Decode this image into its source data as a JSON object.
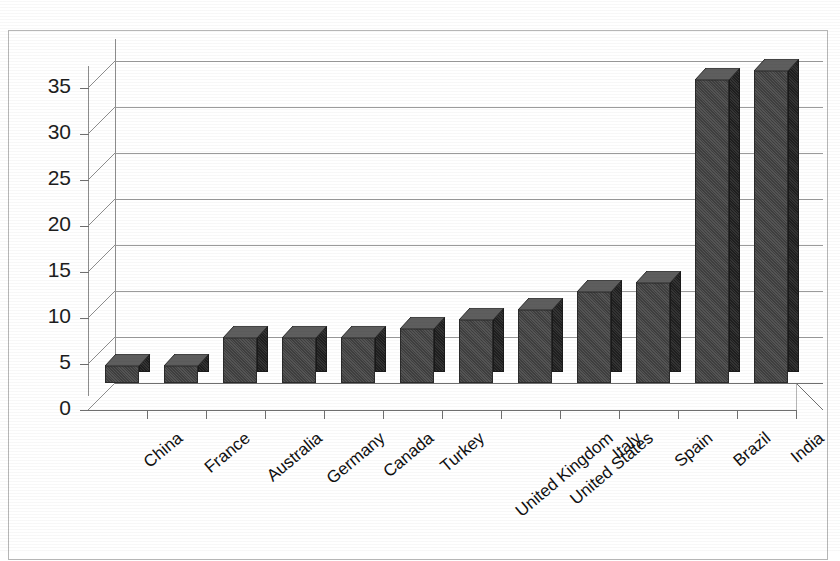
{
  "chart_title": "",
  "chart_data": {
    "type": "bar",
    "title": "",
    "subtitle": "",
    "xlabel": "",
    "ylabel": "",
    "categories": [
      "China",
      "France",
      "Australia",
      "Germany",
      "Canada",
      "Turkey",
      "United Kingdom",
      "United States",
      "Italy",
      "Spain",
      "Brazil",
      "India"
    ],
    "values": [
      2,
      2,
      5,
      5,
      5,
      6,
      7,
      8,
      10,
      11,
      33,
      34
    ],
    "ylim": [
      0,
      35
    ],
    "yticks": [
      0,
      5,
      10,
      15,
      20,
      25,
      30,
      35
    ],
    "ytick_labels": [
      "0",
      "5",
      "10",
      "15",
      "20",
      "25",
      "30",
      "35"
    ],
    "grid": true,
    "legend": false,
    "legend_position": "none",
    "style": "3d-column",
    "series": [
      {
        "name": "",
        "values": [
          2,
          2,
          5,
          5,
          5,
          6,
          7,
          8,
          10,
          11,
          33,
          34
        ]
      }
    ]
  },
  "axis": {
    "y_labels": [
      "35",
      "30",
      "25",
      "20",
      "15",
      "10",
      "5",
      "0"
    ],
    "x_labels": [
      "China",
      "France",
      "Australia",
      "Germany",
      "Canada",
      "Turkey",
      "United Kingdom",
      "United States",
      "Italy",
      "Spain",
      "Brazil",
      "India"
    ]
  },
  "colors": {
    "bar_front": "#4a4a4a",
    "bar_side": "#2b2b2b",
    "gridline": "#9b9b9b",
    "axis": "#6f6f6f",
    "frame": "#b6b6b6",
    "background": "#ffffff",
    "text": "#101010"
  }
}
